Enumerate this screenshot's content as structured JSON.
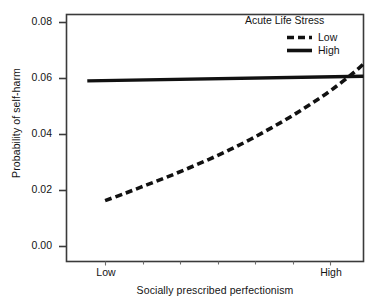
{
  "chart_data": {
    "type": "line",
    "title": "",
    "xlabel": "Socially prescribed perfectionism",
    "ylabel": "Probability of self-harm",
    "xlim": [
      0,
      1
    ],
    "ylim": [
      0.0,
      0.08
    ],
    "grid": false,
    "legend_position": "top-right",
    "legend_title": "Acute Life Stress",
    "xticklabels": [
      "Low",
      "High"
    ],
    "xtickpositions": [
      0.13,
      0.885
    ],
    "yticklabels": [
      "0.00",
      "0.02",
      "0.04",
      "0.06",
      "0.08"
    ],
    "ytickvalues": [
      0.0,
      0.02,
      0.04,
      0.06,
      0.08
    ],
    "series": [
      {
        "name": "Low",
        "style": "dashed",
        "color": "#111111",
        "x": [
          0.13,
          0.2,
          0.27,
          0.34,
          0.41,
          0.48,
          0.55,
          0.62,
          0.69,
          0.76,
          0.83,
          0.9,
          0.97,
          1.0
        ],
        "values": [
          0.0197,
          0.0222,
          0.0248,
          0.0274,
          0.0302,
          0.0331,
          0.0362,
          0.0396,
          0.0433,
          0.0472,
          0.0515,
          0.0561,
          0.0614,
          0.064
        ]
      },
      {
        "name": "High",
        "style": "solid",
        "color": "#111111",
        "x": [
          0.07,
          1.0
        ],
        "values": [
          0.0585,
          0.06
        ]
      }
    ]
  },
  "axes": {
    "y_title": "Probability of self-harm",
    "x_title": "Socially prescribed perfectionism",
    "y_ticks": [
      "0.08",
      "0.06",
      "0.04",
      "0.02",
      "0.00"
    ],
    "x_ticks": [
      "Low",
      "High"
    ]
  },
  "legend": {
    "title": "Acute Life Stress",
    "entries": [
      {
        "label": "Low",
        "style": "dashed"
      },
      {
        "label": "High",
        "style": "solid"
      }
    ]
  },
  "colors": {
    "ink": "#111111",
    "frame": "#3a3a3a",
    "background": "#ffffff"
  }
}
